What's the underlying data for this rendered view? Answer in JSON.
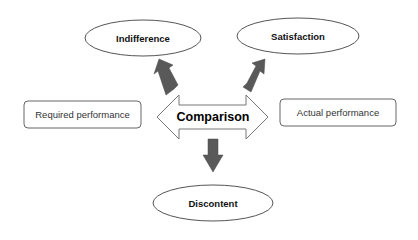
{
  "diagram": {
    "type": "flow",
    "nodes": {
      "indifference": {
        "label": "Indifference",
        "shape": "ellipse"
      },
      "satisfaction": {
        "label": "Satisfaction",
        "shape": "ellipse"
      },
      "discontent": {
        "label": "Discontent",
        "shape": "ellipse"
      },
      "required": {
        "label": "Required performance",
        "shape": "rounded-rect"
      },
      "actual": {
        "label": "Actual performance",
        "shape": "rounded-rect"
      },
      "comparison": {
        "label": "Comparison",
        "shape": "double-arrow"
      }
    },
    "edges": [
      {
        "from": "comparison",
        "to": "indifference",
        "style": "filled-arrow"
      },
      {
        "from": "comparison",
        "to": "satisfaction",
        "style": "filled-arrow"
      },
      {
        "from": "comparison",
        "to": "discontent",
        "style": "filled-arrow"
      },
      {
        "from": "required",
        "to": "actual",
        "via": "comparison",
        "style": "double-headed-outline-arrow"
      }
    ],
    "colors": {
      "outline": "#555555",
      "arrow_fill": "#595959",
      "background": "#ffffff",
      "text": "#111111"
    }
  }
}
